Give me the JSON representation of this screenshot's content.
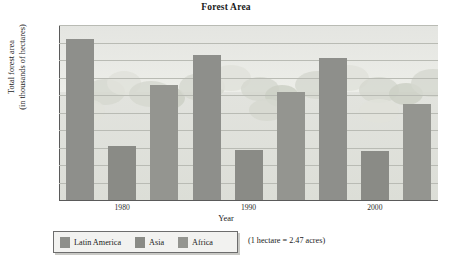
{
  "chart_data": {
    "type": "bar",
    "title": "Forest Area",
    "xlabel": "Year",
    "ylabel": "Total forest area (in thousands of hectares)",
    "ylabel_line1": "Total forest area",
    "ylabel_line2": "(in thousands of hectares)",
    "categories": [
      "1980",
      "1990",
      "2000"
    ],
    "series": [
      {
        "name": "Latin America",
        "values": [
          920,
          830,
          810
        ],
        "color": "#8e8f8b"
      },
      {
        "name": "Asia",
        "values": [
          310,
          285,
          280
        ],
        "color": "#8a8b86"
      },
      {
        "name": "Africa",
        "values": [
          655,
          620,
          550
        ],
        "color": "#949590"
      }
    ],
    "ylim": [
      0,
      1000
    ],
    "yticks": [
      1000,
      900,
      800,
      700,
      600,
      500,
      400,
      300,
      200,
      100,
      0
    ],
    "grid": true,
    "legend_position": "bottom-left",
    "annotation": "(1 hectare = 2.47 acres)"
  },
  "legend": {
    "items": [
      {
        "label": "Latin America"
      },
      {
        "label": "Asia"
      },
      {
        "label": "Africa"
      }
    ]
  }
}
